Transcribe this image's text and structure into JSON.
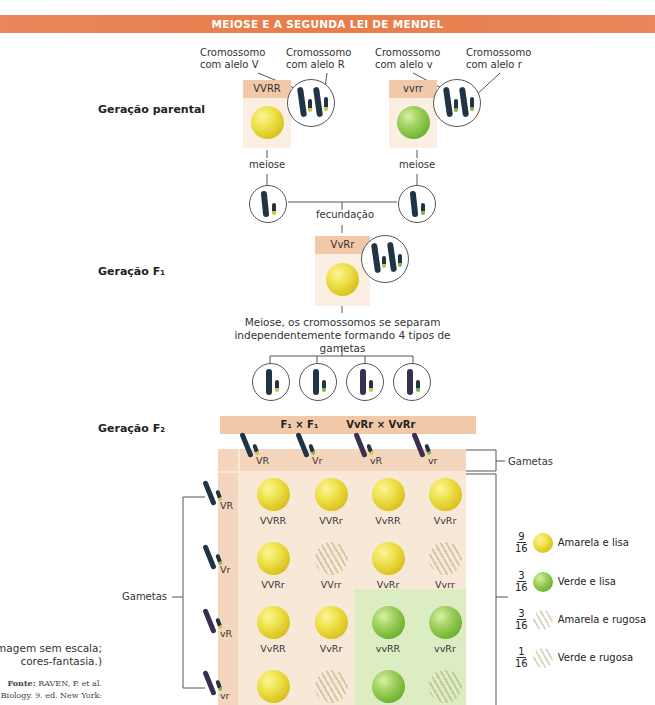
{
  "header": {
    "title": "MEIOSE E A SEGUNDA LEI DE MENDEL",
    "color": "#e8834f"
  },
  "parental": {
    "label": "Geração parental",
    "left": {
      "genotype": "VVRR",
      "pea": "yellow-smooth",
      "chromo_label_1": [
        "Cromossomo",
        "com alelo V"
      ],
      "chromo_label_2": [
        "Cromossomo",
        "com alelo R"
      ],
      "meiosis_label": "meiose"
    },
    "right": {
      "genotype": "vvrr",
      "pea": "green-smooth",
      "chromo_label_1": [
        "Cromossomo",
        "com alelo v"
      ],
      "chromo_label_2": [
        "Cromossomo",
        "com alelo r"
      ],
      "meiosis_label": "meiose"
    },
    "fertilization_label": "fecundação"
  },
  "f1": {
    "label": "Geração F₁",
    "genotype": "VvRr",
    "pea": "yellow-smooth",
    "meiosis_text": [
      "Meiose, os cromossomos se separam",
      "independentemente formando 4 tipos de gametas"
    ]
  },
  "f2": {
    "label": "Geração F₂",
    "cross_title_left": "F₁ × F₁",
    "cross_title_right": "VvRr × VvRr",
    "gametes_label_top": "Gametas",
    "gametes_label_left": "Gametas",
    "column_gametes": [
      "VR",
      "Vr",
      "vR",
      "vr"
    ],
    "row_gametes": [
      "VR",
      "Vr",
      "vR",
      "vr"
    ],
    "grid": [
      [
        {
          "g": "VVRR",
          "p": "yellow-smooth"
        },
        {
          "g": "VVRr",
          "p": "yellow-smooth"
        },
        {
          "g": "VvRR",
          "p": "yellow-smooth"
        },
        {
          "g": "VvRr",
          "p": "yellow-smooth"
        }
      ],
      [
        {
          "g": "VVRr",
          "p": "yellow-smooth"
        },
        {
          "g": "VVrr",
          "p": "yellow-wrinkled"
        },
        {
          "g": "VvRr",
          "p": "yellow-smooth"
        },
        {
          "g": "Vvrr",
          "p": "yellow-wrinkled"
        }
      ],
      [
        {
          "g": "VvRR",
          "p": "yellow-smooth"
        },
        {
          "g": "VvRr",
          "p": "yellow-smooth"
        },
        {
          "g": "vvRR",
          "p": "green-smooth"
        },
        {
          "g": "vvRr",
          "p": "green-smooth"
        }
      ],
      [
        {
          "g": "",
          "p": "yellow-smooth"
        },
        {
          "g": "",
          "p": "yellow-wrinkled"
        },
        {
          "g": "",
          "p": "green-smooth"
        },
        {
          "g": "",
          "p": "green-wrinkled"
        }
      ]
    ],
    "legend": [
      {
        "num": "9",
        "den": "16",
        "label": "Amarela e lisa",
        "pea": "yellow-smooth"
      },
      {
        "num": "3",
        "den": "16",
        "label": "Verde e lisa",
        "pea": "green-smooth"
      },
      {
        "num": "3",
        "den": "16",
        "label": "Amarela e rugosa",
        "pea": "yellow-wrinkled"
      },
      {
        "num": "1",
        "den": "16",
        "label": "Verde e rugosa",
        "pea": "green-wrinkled"
      }
    ]
  },
  "caption": {
    "scale_note": [
      "(Imagem sem escala;",
      "cores-fantasia.)"
    ],
    "source_bold": "Fonte:",
    "source_text_1": " RAVEN, P. et al.",
    "source_text_2": "Biology. 9. ed. New York:"
  }
}
